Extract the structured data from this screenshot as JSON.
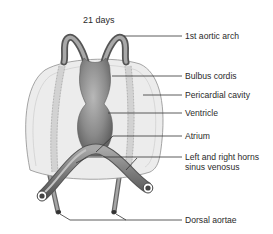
{
  "figure": {
    "title": "21 days",
    "labels": [
      {
        "id": "aortic-arch",
        "text": "1st aortic arch",
        "x": 185,
        "y": 39
      },
      {
        "id": "bulbus-cordis",
        "text": "Bulbus cordis",
        "x": 185,
        "y": 79
      },
      {
        "id": "pericardial-cavity",
        "text": "Pericardial cavity",
        "x": 185,
        "y": 98
      },
      {
        "id": "ventricle",
        "text": "Ventricle",
        "x": 185,
        "y": 116
      },
      {
        "id": "atrium",
        "text": "Atrium",
        "x": 185,
        "y": 140
      },
      {
        "id": "horns-line1",
        "text": "Left and right horns",
        "x": 185,
        "y": 161
      },
      {
        "id": "horns-line2",
        "text": "sinus venosus",
        "x": 185,
        "y": 172
      },
      {
        "id": "dorsal-aortae",
        "text": "Dorsal aortae",
        "x": 185,
        "y": 220
      }
    ]
  },
  "colors": {
    "heart_fill": "#8c8c8c",
    "cavity_fill": "#ececec",
    "cavity_stroke": "#9a9a9a",
    "leader": "#333333"
  }
}
